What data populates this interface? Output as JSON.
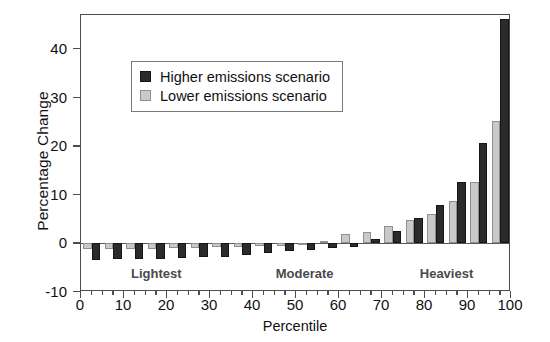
{
  "chart_data": {
    "type": "bar",
    "title": "",
    "subtitle": "",
    "xlabel": "Percentile",
    "ylabel": "Percentage Change",
    "xlim": [
      0,
      100
    ],
    "ylim": [
      -10,
      47
    ],
    "grid": false,
    "legend_position": "top-left-inset",
    "x_ticks": [
      0,
      10,
      20,
      30,
      40,
      50,
      60,
      70,
      80,
      90,
      100
    ],
    "x_tick_labels": [
      "0",
      "10",
      "20",
      "30",
      "40",
      "50",
      "60",
      "70",
      "80",
      "90",
      "100"
    ],
    "y_ticks": [
      -10,
      0,
      10,
      20,
      30,
      40
    ],
    "y_tick_labels": [
      "-10",
      "0",
      "10",
      "20",
      "30",
      "40"
    ],
    "categories": [
      2.5,
      7.5,
      12.5,
      17.5,
      22.5,
      27.5,
      32.5,
      37.5,
      42.5,
      47.5,
      52.5,
      57.5,
      62.5,
      67.5,
      72.5,
      77.5,
      82.5,
      87.5,
      92.5,
      97.5
    ],
    "series": [
      {
        "name": "Higher emissions scenario",
        "color": "#2b2b2b",
        "values": [
          -3.4,
          -3.3,
          -3.2,
          -3.3,
          -3.0,
          -2.9,
          -2.7,
          -2.4,
          -1.9,
          -1.6,
          -1.3,
          -1.0,
          -0.7,
          1.0,
          2.6,
          5.2,
          7.9,
          12.6,
          20.7,
          46.2
        ]
      },
      {
        "name": "Lower emissions scenario",
        "color": "#c9c9c9",
        "values": [
          -1.2,
          -1.2,
          -1.1,
          -1.1,
          -1.0,
          -0.9,
          -0.8,
          -0.7,
          -0.6,
          -0.5,
          -0.3,
          0.4,
          1.9,
          2.4,
          3.6,
          4.8,
          6.1,
          8.7,
          12.6,
          25.1
        ]
      }
    ],
    "annotations": [
      {
        "text": "Lightest",
        "x": 17.5,
        "y": -6.3
      },
      {
        "text": "Moderate",
        "x": 52.0,
        "y": -6.3
      },
      {
        "text": "Heaviest",
        "x": 85.0,
        "y": -6.3
      }
    ]
  },
  "legend": {
    "entries": [
      {
        "label": "Higher emissions scenario",
        "swatch": "high"
      },
      {
        "label": "Lower emissions scenario",
        "swatch": "low"
      }
    ]
  }
}
